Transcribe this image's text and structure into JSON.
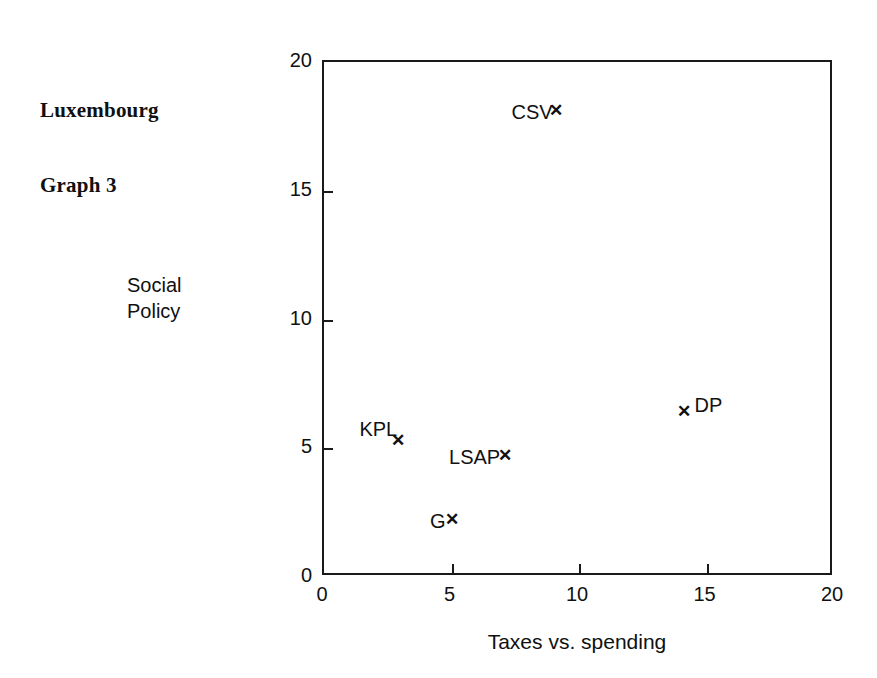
{
  "corner_title": {
    "line1": "Luxembourg",
    "line2": "Graph 3"
  },
  "chart_data": {
    "type": "scatter",
    "title": "Luxembourg Graph 3",
    "xlabel": "Taxes vs. spending",
    "ylabel": "Social Policy",
    "ylabel_line1": "Social",
    "ylabel_line2": "Policy",
    "xlim": [
      0,
      20
    ],
    "ylim": [
      0,
      20
    ],
    "xticks": [
      0,
      5,
      10,
      15,
      20
    ],
    "yticks": [
      0,
      5,
      10,
      15,
      20
    ],
    "xtick_labels": [
      "0",
      "5",
      "10",
      "15",
      "20"
    ],
    "ytick_labels": [
      "0",
      "5",
      "10",
      "15",
      "20"
    ],
    "grid": false,
    "legend": "none",
    "marker": "x",
    "points": [
      {
        "name": "CSV",
        "x": 9.1,
        "y": 18.1,
        "label_side": "left"
      },
      {
        "name": "DP",
        "x": 14.1,
        "y": 6.4,
        "label_side": "upper-right"
      },
      {
        "name": "KPL",
        "x": 2.9,
        "y": 5.3,
        "label_side": "upper-left"
      },
      {
        "name": "LSAP",
        "x": 7.1,
        "y": 4.7,
        "label_side": "left"
      },
      {
        "name": "G",
        "x": 5.0,
        "y": 2.2,
        "label_side": "left"
      }
    ]
  }
}
